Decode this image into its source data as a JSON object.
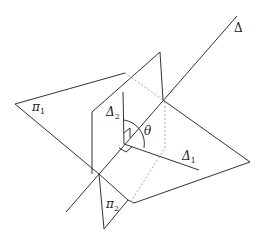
{
  "diagram": {
    "type": "geometry-3d",
    "labels": {
      "delta": {
        "symbol": "Δ",
        "sub": ""
      },
      "delta1": {
        "symbol": "Δ",
        "sub": "1"
      },
      "delta2": {
        "symbol": "Δ",
        "sub": "2"
      },
      "pi1": {
        "symbol": "π",
        "sub": "1"
      },
      "pi2": {
        "symbol": "π",
        "sub": "2"
      },
      "theta": {
        "symbol": "θ"
      }
    },
    "colors": {
      "line": "#333333",
      "hidden": "#aaaaaa",
      "background": "#ffffff"
    }
  }
}
